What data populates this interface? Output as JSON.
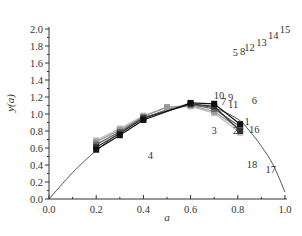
{
  "chart_data": {
    "type": "line",
    "title": "",
    "xlabel": "a",
    "ylabel": "y(a)",
    "xlim": [
      0.0,
      1.0
    ],
    "ylim": [
      0.0,
      2.0
    ],
    "xticks": [
      "0.0",
      "0.2",
      "0.4",
      "0.6",
      "0.8",
      "1.0"
    ],
    "yticks": [
      "0.0",
      "0.2",
      "0.4",
      "0.6",
      "0.8",
      "1.0",
      "1.2",
      "1.4",
      "1.6",
      "1.8",
      "2.0"
    ],
    "grid": false,
    "legend": null,
    "curve": {
      "name": "reference curve",
      "x": [
        0.0,
        0.1,
        0.2,
        0.3,
        0.4,
        0.5,
        0.6,
        0.7,
        0.8,
        0.85,
        0.9,
        0.95,
        1.0
      ],
      "y": [
        0.0,
        0.31,
        0.57,
        0.78,
        0.94,
        1.05,
        1.1,
        1.07,
        0.94,
        0.8,
        0.62,
        0.4,
        0.08
      ]
    },
    "series": [
      {
        "name": "s1",
        "color": "#111111",
        "x": [
          0.2,
          0.3,
          0.4,
          0.6,
          0.7,
          0.81
        ],
        "y": [
          0.58,
          0.75,
          0.93,
          1.13,
          1.12,
          0.88
        ]
      },
      {
        "name": "s2",
        "color": "#333333",
        "x": [
          0.2,
          0.3,
          0.4,
          0.6,
          0.7,
          0.81
        ],
        "y": [
          0.61,
          0.77,
          0.95,
          1.12,
          1.09,
          0.8
        ]
      },
      {
        "name": "s3",
        "color": "#666666",
        "x": [
          0.2,
          0.3,
          0.4,
          0.6,
          0.7,
          0.81
        ],
        "y": [
          0.64,
          0.79,
          0.96,
          1.11,
          1.06,
          0.85
        ]
      },
      {
        "name": "s4",
        "color": "#999999",
        "x": [
          0.2,
          0.3,
          0.4,
          0.5,
          0.6,
          0.7,
          0.81
        ],
        "y": [
          0.67,
          0.81,
          0.97,
          1.08,
          1.1,
          1.03,
          0.82
        ]
      },
      {
        "name": "s5",
        "color": "#bbbbbb",
        "x": [
          0.2,
          0.3,
          0.4,
          0.5,
          0.6,
          0.7,
          0.81
        ],
        "y": [
          0.69,
          0.83,
          0.98,
          1.08,
          1.09,
          1.01,
          0.78
        ]
      }
    ],
    "annotations": [
      {
        "text": "1",
        "x": 0.84,
        "y": 0.87
      },
      {
        "text": "2",
        "x": 0.79,
        "y": 0.77
      },
      {
        "text": "3",
        "x": 0.7,
        "y": 0.77
      },
      {
        "text": "4",
        "x": 0.43,
        "y": 0.47
      },
      {
        "text": "5",
        "x": 0.79,
        "y": 1.68
      },
      {
        "text": "6",
        "x": 0.87,
        "y": 1.12
      },
      {
        "text": "7",
        "x": 0.74,
        "y": 1.11
      },
      {
        "text": "8",
        "x": 0.82,
        "y": 1.7
      },
      {
        "text": "9",
        "x": 0.77,
        "y": 1.15
      },
      {
        "text": "10",
        "x": 0.72,
        "y": 1.18
      },
      {
        "text": "11",
        "x": 0.78,
        "y": 1.07
      },
      {
        "text": "12",
        "x": 0.85,
        "y": 1.74
      },
      {
        "text": "13",
        "x": 0.9,
        "y": 1.8
      },
      {
        "text": "14",
        "x": 0.95,
        "y": 1.88
      },
      {
        "text": "15",
        "x": 1.0,
        "y": 1.95
      },
      {
        "text": "16",
        "x": 0.87,
        "y": 0.78
      },
      {
        "text": "17",
        "x": 0.94,
        "y": 0.31
      },
      {
        "text": "18",
        "x": 0.86,
        "y": 0.36
      }
    ]
  }
}
